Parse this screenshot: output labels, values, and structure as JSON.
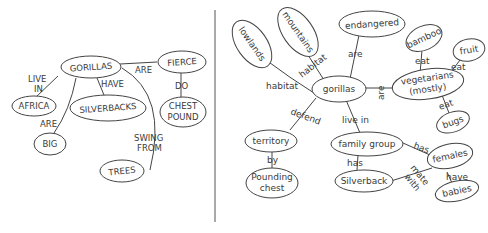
{
  "top_cutoff_text": "Concept map of gorillas",
  "left_map": {
    "nodes": [
      {
        "id": "gorillas",
        "label": "GORILLAS"
      },
      {
        "id": "fierce",
        "label": "FIERCE"
      },
      {
        "id": "africa",
        "label": "AFRICA"
      },
      {
        "id": "silverbacks",
        "label": "SILVERBACKS"
      },
      {
        "id": "chest_pound_1",
        "label": "CHEST"
      },
      {
        "id": "chest_pound_2",
        "label": "POUND"
      },
      {
        "id": "big",
        "label": "BIG"
      },
      {
        "id": "trees",
        "label": "TREES"
      }
    ],
    "edges": [
      {
        "from": "gorillas",
        "to": "fierce",
        "label": "ARE"
      },
      {
        "from": "gorillas",
        "to": "africa",
        "label1": "LIVE",
        "label2": "IN"
      },
      {
        "from": "gorillas",
        "to": "silverbacks",
        "label": "HAVE"
      },
      {
        "from": "fierce",
        "to": "chest_pound",
        "label": "DO"
      },
      {
        "from": "gorillas",
        "to": "big",
        "label": "ARE"
      },
      {
        "from": "gorillas",
        "to": "trees",
        "label1": "SWING",
        "label2": "FROM"
      }
    ]
  },
  "right_map": {
    "nodes": [
      {
        "id": "lowlands",
        "label": "lowlands"
      },
      {
        "id": "mountains",
        "label": "mountains"
      },
      {
        "id": "endangered",
        "label": "endangered"
      },
      {
        "id": "bamboo",
        "label": "bamboo"
      },
      {
        "id": "fruit",
        "label": "fruit"
      },
      {
        "id": "gorillas",
        "label": "gorillas"
      },
      {
        "id": "vegetarians_1",
        "label": "vegetarians"
      },
      {
        "id": "vegetarians_2",
        "label": "(mostly)"
      },
      {
        "id": "bugs",
        "label": "bugs"
      },
      {
        "id": "territory",
        "label": "territory"
      },
      {
        "id": "family_group",
        "label": "family group"
      },
      {
        "id": "females",
        "label": "females"
      },
      {
        "id": "pounding_1",
        "label": "Pounding"
      },
      {
        "id": "pounding_2",
        "label": "chest"
      },
      {
        "id": "silverback",
        "label": "Silverback"
      },
      {
        "id": "babies",
        "label": "babies"
      }
    ],
    "edges": [
      {
        "from": "gorillas",
        "to": "lowlands",
        "label": "habitat"
      },
      {
        "from": "gorillas",
        "to": "mountains",
        "label": "habitat"
      },
      {
        "from": "gorillas",
        "to": "endangered",
        "label": "are"
      },
      {
        "from": "gorillas",
        "to": "vegetarians",
        "label": "are"
      },
      {
        "from": "vegetarians",
        "to": "bamboo",
        "label": "eat"
      },
      {
        "from": "vegetarians",
        "to": "fruit",
        "label": "eat"
      },
      {
        "from": "vegetarians",
        "to": "bugs",
        "label": "eat"
      },
      {
        "from": "gorillas",
        "to": "territory",
        "label": "defend"
      },
      {
        "from": "territory",
        "to": "pounding_chest",
        "label": "by"
      },
      {
        "from": "gorillas",
        "to": "family_group",
        "label": "live in"
      },
      {
        "from": "family_group",
        "to": "silverback",
        "label": "has"
      },
      {
        "from": "family_group",
        "to": "females",
        "label": "has"
      },
      {
        "from": "silverback",
        "to": "females",
        "label1": "mate",
        "label2": "with"
      },
      {
        "from": "females",
        "to": "babies",
        "label": "have"
      }
    ]
  }
}
